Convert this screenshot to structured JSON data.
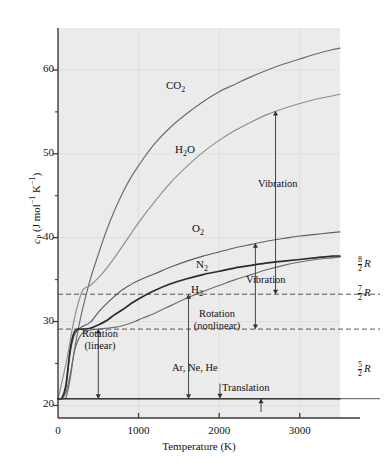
{
  "chart_data": {
    "type": "line",
    "title": "",
    "xlabel": "Temperature (K)",
    "ylabel": "c_P (J mol⁻¹ K⁻¹)",
    "xlim": [
      0,
      3500
    ],
    "ylim": [
      18.5,
      65
    ],
    "xticks": [
      0,
      1000,
      2000,
      3000
    ],
    "xtick_labels": [
      "0",
      "1000",
      "2000",
      "3000"
    ],
    "yticks": [
      20,
      30,
      40,
      50,
      60
    ],
    "ytick_labels": [
      "20",
      "30",
      "40",
      "50",
      "60"
    ],
    "yminor": [
      25,
      35,
      45,
      55
    ],
    "grid": true,
    "legend": "inline-curve-labels",
    "series": [
      {
        "name": "CO2",
        "label": "CO₂",
        "color": "#6b6b6b",
        "x": [
          0,
          50,
          100,
          150,
          200,
          250,
          300,
          400,
          500,
          600,
          700,
          800,
          900,
          1000,
          1200,
          1400,
          1600,
          1800,
          2000,
          2200,
          2400,
          2600,
          2800,
          3000,
          3200,
          3400,
          3500
        ],
        "y": [
          20.8,
          20.9,
          21.6,
          23.6,
          26.4,
          29.0,
          31.3,
          35.0,
          38.0,
          40.8,
          43.2,
          45.3,
          47.1,
          48.6,
          51.2,
          53.2,
          54.8,
          56.2,
          57.4,
          58.3,
          59.2,
          60.0,
          60.7,
          61.3,
          61.9,
          62.4,
          62.6
        ]
      },
      {
        "name": "H2O",
        "label": "H₂O",
        "color": "#8d8d8d",
        "x": [
          0,
          100,
          200,
          300,
          400,
          500,
          600,
          700,
          800,
          900,
          1000,
          1200,
          1400,
          1600,
          1800,
          2000,
          2200,
          2400,
          2600,
          2800,
          3000,
          3200,
          3400,
          3500
        ],
        "y": [
          20.8,
          25.0,
          30.2,
          33.6,
          34.3,
          35.2,
          36.3,
          37.6,
          39.0,
          40.4,
          41.8,
          44.3,
          46.6,
          48.5,
          50.2,
          51.6,
          52.8,
          53.8,
          54.7,
          55.4,
          56.0,
          56.5,
          56.9,
          57.1
        ]
      },
      {
        "name": "O2",
        "label": "O₂",
        "color": "#5d5d5d",
        "x": [
          0,
          50,
          100,
          150,
          200,
          250,
          300,
          400,
          500,
          600,
          700,
          800,
          900,
          1000,
          1200,
          1400,
          1600,
          1800,
          2000,
          2200,
          2400,
          2600,
          2800,
          3000,
          3200,
          3400,
          3500
        ],
        "y": [
          20.8,
          20.9,
          22.4,
          26.2,
          28.3,
          29.0,
          29.4,
          29.9,
          31.1,
          32.1,
          33.0,
          33.8,
          34.4,
          34.9,
          35.7,
          36.5,
          37.2,
          37.8,
          38.3,
          38.8,
          39.2,
          39.6,
          39.9,
          40.2,
          40.4,
          40.6,
          40.7
        ]
      },
      {
        "name": "N2",
        "label": "N₂",
        "color": "#2b2b2b",
        "x": [
          0,
          50,
          100,
          150,
          200,
          250,
          300,
          400,
          500,
          600,
          700,
          800,
          900,
          1000,
          1200,
          1400,
          1600,
          1800,
          2000,
          2200,
          2400,
          2600,
          2800,
          3000,
          3200,
          3400,
          3500
        ],
        "y": [
          20.8,
          20.9,
          22.5,
          26.6,
          28.7,
          29.1,
          29.1,
          29.2,
          29.6,
          30.1,
          30.8,
          31.4,
          32.1,
          32.7,
          33.7,
          34.5,
          35.1,
          35.6,
          36.0,
          36.4,
          36.7,
          37.0,
          37.2,
          37.4,
          37.6,
          37.8,
          37.8
        ]
      },
      {
        "name": "H2",
        "label": "H₂",
        "color": "#6b6b6b",
        "x": [
          0,
          50,
          100,
          150,
          200,
          250,
          300,
          350,
          400,
          500,
          600,
          700,
          800,
          900,
          1000,
          1200,
          1400,
          1600,
          1800,
          2000,
          2200,
          2400,
          2600,
          2800,
          3000,
          3200,
          3400,
          3500
        ],
        "y": [
          20.8,
          20.8,
          21.0,
          23.1,
          26.3,
          27.8,
          28.6,
          28.8,
          29.0,
          29.1,
          29.2,
          29.3,
          29.5,
          29.8,
          30.2,
          31.0,
          31.9,
          32.8,
          33.6,
          34.3,
          35.0,
          35.6,
          36.2,
          36.7,
          37.1,
          37.4,
          37.6,
          37.7
        ]
      },
      {
        "name": "ArNeHe",
        "label": "Ar, Ne, He",
        "color": "#3a3a3a",
        "x": [
          0,
          3500
        ],
        "y": [
          20.8,
          20.8
        ]
      }
    ],
    "reference_lines": [
      {
        "name": "eight-halves-R",
        "value": 33.26,
        "label_num": "8",
        "label_den": "2",
        "label_sym": "R",
        "style": "dashed"
      },
      {
        "name": "seven-halves-R",
        "value": 29.1,
        "label_num": "7",
        "label_den": "2",
        "label_sym": "R",
        "style": "dashed"
      },
      {
        "name": "five-halves-R",
        "value": 20.8,
        "label_num": "5",
        "label_den": "2",
        "label_sym": "R",
        "style": "solid"
      }
    ],
    "annotations": [
      {
        "name": "vibration-upper",
        "text": "Vibration",
        "arrow": "double-vertical"
      },
      {
        "name": "vibration-lower",
        "text": "Vibration",
        "arrow": "double-vertical"
      },
      {
        "name": "rotation-linear",
        "text": "Rotation\n(linear)",
        "line1": "Rotation",
        "line2": "(linear)",
        "arrow": "double-vertical"
      },
      {
        "name": "rotation-nonlinear",
        "text": "Rotation\n(nonlinear)",
        "line1": "Rotation",
        "line2": "(nonlinear)",
        "arrow": "double-vertical"
      },
      {
        "name": "translation",
        "text": "Translation",
        "arrow": "up"
      }
    ]
  },
  "axes": {
    "ylabel_main": "c",
    "ylabel_sub": "P",
    "ylabel_units_open": " (J mol",
    "ylabel_exp1": "−1",
    "ylabel_mid": " K",
    "ylabel_exp2": "−1",
    "ylabel_close": ")",
    "xlabel": "Temperature (K)"
  },
  "colors": {
    "plot_background": "#ebebeb",
    "grid": "#d8d8d8",
    "axis": "#3a3a3a",
    "text": "#111111"
  }
}
